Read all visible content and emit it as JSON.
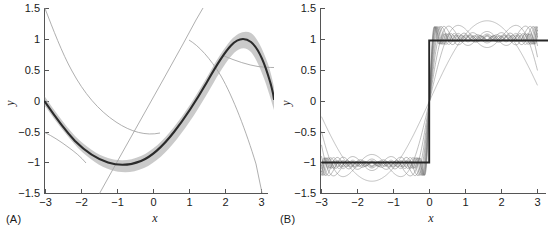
{
  "figure": {
    "background_color": "#ffffff",
    "panels": [
      {
        "id": "A",
        "label": "(A)",
        "xlabel": "x",
        "ylabel": "y",
        "xlim": [
          -3.2,
          3.2
        ],
        "ylim": [
          -1.5,
          1.5
        ],
        "xticks": [
          -3,
          -2,
          -1,
          0,
          1,
          2,
          3
        ],
        "xticklabels": [
          "−3",
          "−2",
          "−1",
          "0",
          "1",
          "2",
          "3"
        ],
        "yticks": [
          -1.5,
          -1,
          -0.5,
          0,
          0.5,
          1,
          1.5
        ],
        "yticklabels": [
          "−1.5",
          "−1",
          "−0.5",
          "0",
          "0.5",
          "1",
          "1.5"
        ],
        "grid": false,
        "legend": "none"
      },
      {
        "id": "B",
        "label": "(B)",
        "xlabel": "x",
        "ylabel": "y",
        "xlim": [
          -3.2,
          3.2
        ],
        "ylim": [
          -1.5,
          1.5
        ],
        "xticks": [
          -3,
          -2,
          -1,
          0,
          1,
          2,
          3
        ],
        "xticklabels": [
          "−3",
          "−2",
          "−1",
          "0",
          "1",
          "2",
          "3"
        ],
        "yticks": [
          -1.5,
          -1,
          -0.5,
          0,
          0.5,
          1,
          1.5
        ],
        "yticklabels": [
          "−1.5",
          "−1",
          "−0.5",
          "0",
          "0.5",
          "1",
          "1.5"
        ],
        "grid": false,
        "legend": "none"
      }
    ],
    "colors": {
      "mean_line": "#2b2b2b",
      "band": "#9a9a9a",
      "sample_line": "#6e6e6e",
      "thin_line": "#8a8a8a",
      "axis": "#555555",
      "text": "#1a1a1a"
    }
  },
  "chart_data": [
    {
      "type": "line",
      "panel": "A",
      "title": "",
      "xlabel": "x",
      "ylabel": "y",
      "xlim": [
        -3.2,
        3.2
      ],
      "ylim": [
        -1.5,
        1.5
      ],
      "xticks": [
        -3,
        -2,
        -1,
        0,
        1,
        2,
        3
      ],
      "yticks": [
        -1.5,
        -1,
        -0.5,
        0,
        0.5,
        1,
        1.5
      ],
      "grid": false,
      "legend": "none",
      "series": [
        {
          "name": "posterior mean",
          "kind": "mean-line",
          "x": [
            -3.0,
            -2.75,
            -2.5,
            -2.25,
            -2.0,
            -1.75,
            -1.5,
            -1.25,
            -1.0,
            -0.75,
            -0.5,
            -0.25,
            0.0,
            0.25,
            0.5,
            0.75,
            1.0,
            1.25,
            1.5,
            1.75,
            2.0,
            2.25,
            2.5,
            2.75,
            3.0,
            3.2
          ],
          "values": [
            -0.02,
            -0.33,
            -0.6,
            -0.79,
            -0.91,
            -0.99,
            -1.0,
            -0.97,
            -0.86,
            -0.69,
            -0.49,
            -0.26,
            0.0,
            0.26,
            0.49,
            0.69,
            0.86,
            0.97,
            1.01,
            0.99,
            0.9,
            0.76,
            0.55,
            0.3,
            0.03,
            -0.12
          ]
        },
        {
          "name": "uncertainty band upper",
          "kind": "band-upper",
          "x": [
            -3.0,
            -2.5,
            -2.0,
            -1.5,
            -1.0,
            -0.5,
            0.0,
            0.5,
            1.0,
            1.5,
            2.0,
            2.5,
            3.0,
            3.2
          ],
          "values": [
            0.07,
            -0.53,
            -0.85,
            -0.93,
            -0.8,
            -0.44,
            0.05,
            0.54,
            0.91,
            1.06,
            0.96,
            0.64,
            0.15,
            0.0
          ]
        },
        {
          "name": "uncertainty band lower",
          "kind": "band-lower",
          "x": [
            -3.0,
            -2.5,
            -2.0,
            -1.5,
            -1.0,
            -0.5,
            0.0,
            0.5,
            1.0,
            1.5,
            2.0,
            2.5,
            3.0,
            3.2
          ],
          "values": [
            -0.11,
            -0.67,
            -0.97,
            -1.07,
            -0.92,
            -0.54,
            -0.05,
            0.44,
            0.81,
            0.96,
            0.84,
            0.46,
            -0.09,
            -0.24
          ]
        },
        {
          "name": "basis function 1 (steep descending)",
          "kind": "thin-line",
          "x": [
            -3.05,
            -2.5,
            -2.0,
            -1.5,
            -1.0,
            -0.5,
            0.0,
            0.5,
            1.0,
            1.4
          ],
          "values": [
            1.5,
            0.62,
            -0.1,
            -0.62,
            -0.95,
            -1.1,
            -1.05,
            -0.8,
            -0.38,
            0.1
          ]
        },
        {
          "name": "basis function 2 (ascending straight)",
          "kind": "thin-line",
          "x": [
            -1.45,
            -1.0,
            -0.5,
            0.0,
            0.5,
            1.0,
            1.4
          ],
          "values": [
            -1.5,
            -1.0,
            -0.44,
            0.12,
            0.68,
            1.24,
            1.68
          ]
        },
        {
          "name": "basis function 3 (descending to lower right)",
          "kind": "thin-line",
          "x": [
            1.0,
            1.4,
            1.8,
            2.2,
            2.6,
            3.0,
            3.12
          ],
          "values": [
            1.02,
            0.88,
            0.6,
            0.18,
            -0.42,
            -1.2,
            -1.5
          ]
        },
        {
          "name": "basis function 4 (low left tail)",
          "kind": "thin-line",
          "x": [
            -3.05,
            -2.7,
            -2.4,
            -2.1,
            -1.8,
            -1.5
          ],
          "values": [
            -0.5,
            -0.62,
            -0.76,
            -0.9,
            -1.04,
            -1.18
          ]
        },
        {
          "name": "basis function 5 (right plateau)",
          "kind": "thin-line",
          "x": [
            2.2,
            2.5,
            2.8,
            3.0,
            3.2
          ],
          "values": [
            0.76,
            0.64,
            0.57,
            0.55,
            0.55
          ]
        }
      ]
    },
    {
      "type": "line",
      "panel": "B",
      "title": "",
      "xlabel": "x",
      "ylabel": "y",
      "xlim": [
        -3.2,
        3.2
      ],
      "ylim": [
        -1.5,
        1.5
      ],
      "xticks": [
        -3,
        -2,
        -1,
        0,
        1,
        2,
        3
      ],
      "yticks": [
        -1.5,
        -1,
        -0.5,
        0,
        0.5,
        1,
        1.5
      ],
      "grid": false,
      "legend": "none",
      "series": [
        {
          "name": "step function (target)",
          "kind": "mean-line",
          "x": [
            -3.0,
            -0.001,
            0.0,
            3.2
          ],
          "values": [
            -1.0,
            -1.0,
            1.0,
            1.0
          ]
        },
        {
          "name": "sample functions",
          "kind": "oscillating-samples",
          "description": "multiple Fourier-like sample curves oscillating about the step function, amplitude ~0.18, frequencies 1-12, all passing through y=0 at x=0 and converging at the endpoints",
          "count": 12,
          "amplitude": 0.18,
          "frequencies": [
            1,
            2,
            3,
            4,
            5,
            6,
            7,
            8,
            9,
            10,
            11,
            12
          ],
          "baseline_low": -1.0,
          "baseline_high": 1.0
        }
      ]
    }
  ]
}
